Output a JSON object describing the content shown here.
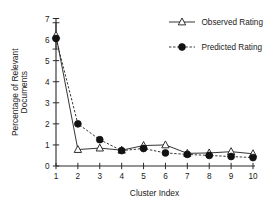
{
  "chart_data": {
    "type": "line",
    "title": "",
    "xlabel": "Cluster Index",
    "ylabel": "Percentage of Relevant Documents",
    "ylabel_lines": [
      "Percentage of Relevant",
      "Documents"
    ],
    "x": [
      1,
      2,
      3,
      4,
      5,
      6,
      7,
      8,
      9,
      10
    ],
    "categories": [
      "1",
      "2",
      "3",
      "4",
      "5",
      "6",
      "7",
      "8",
      "9",
      "10"
    ],
    "xtick_labels": [
      "1",
      "2",
      "3",
      "4",
      "5",
      "6",
      "7",
      "8",
      "9",
      "10"
    ],
    "ytick_labels": [
      "0",
      "1",
      "2",
      "3",
      "4",
      "5",
      "6",
      "7"
    ],
    "yticks": [
      0,
      1,
      2,
      3,
      4,
      5,
      6,
      7
    ],
    "xlim": [
      1,
      10
    ],
    "ylim": [
      0,
      7
    ],
    "grid": false,
    "legend_position": "top-right",
    "series": [
      {
        "name": "Observed Rating",
        "marker": "open-triangle",
        "linestyle": "solid",
        "color": "#1a1a1a",
        "values": [
          6.2,
          0.78,
          0.85,
          0.75,
          0.97,
          1.0,
          0.6,
          0.62,
          0.68,
          0.58
        ],
        "error_bars": [
          {
            "x": 1,
            "y": 6.2,
            "upper": 6.8,
            "lower": 5.55
          }
        ]
      },
      {
        "name": "Predicted Rating",
        "marker": "filled-circle",
        "linestyle": "dashed",
        "color": "#121212",
        "values": [
          6.05,
          2.0,
          1.25,
          0.73,
          0.83,
          0.62,
          0.55,
          0.5,
          0.45,
          0.4
        ],
        "error_bars": []
      }
    ],
    "legend": [
      {
        "label": "Observed Rating",
        "marker": "open-triangle",
        "linestyle": "solid"
      },
      {
        "label": "Predicted Rating",
        "marker": "filled-circle",
        "linestyle": "dashed"
      }
    ]
  }
}
